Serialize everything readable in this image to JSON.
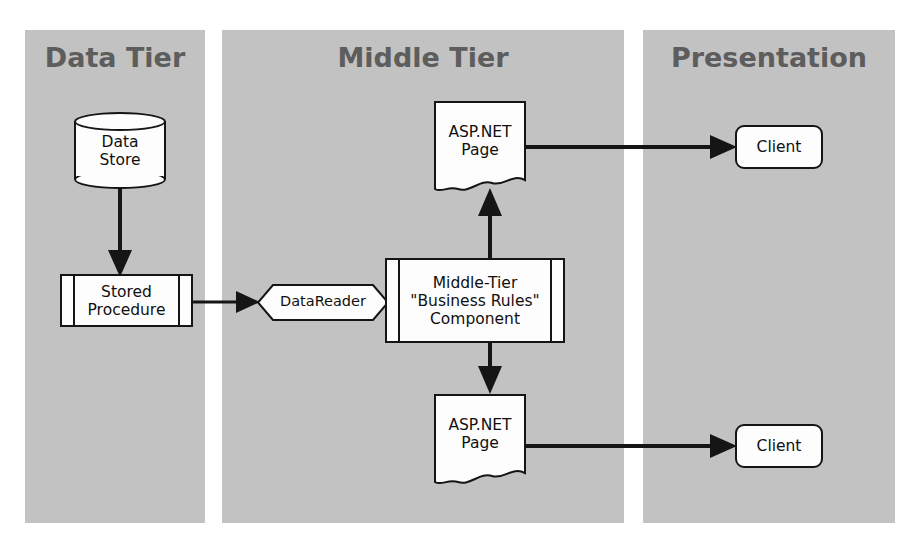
{
  "diagram": {
    "colors": {
      "panel_fill": "#c2c2c2",
      "tier_title": "#5d5d5d",
      "shape_fill": "#fdfdfd",
      "stroke": "#151515",
      "background": "#ffffff"
    },
    "tiers": [
      {
        "id": "data",
        "title": "Data Tier"
      },
      {
        "id": "middle",
        "title": "Middle Tier"
      },
      {
        "id": "presentation",
        "title": "Presentation"
      }
    ],
    "nodes": {
      "data_store": {
        "label": "Data\nStore",
        "shape": "cylinder",
        "tier": "data"
      },
      "stored_procedure": {
        "label": "Stored\nProcedure",
        "shape": "predefined-process",
        "tier": "data"
      },
      "datareader": {
        "label": "DataReader",
        "shape": "hexagon",
        "tier": "middle"
      },
      "business_rules": {
        "label": "Middle-Tier\n\"Business Rules\"\nComponent",
        "shape": "predefined-process",
        "tier": "middle"
      },
      "aspnet_page_top": {
        "label": "ASP.NET\nPage",
        "shape": "document",
        "tier": "middle"
      },
      "aspnet_page_bottom": {
        "label": "ASP.NET\nPage",
        "shape": "document",
        "tier": "middle"
      },
      "client_top": {
        "label": "Client",
        "shape": "rounded-rect",
        "tier": "presentation"
      },
      "client_bottom": {
        "label": "Client",
        "shape": "rounded-rect",
        "tier": "presentation"
      }
    },
    "edges": [
      {
        "from": "data_store",
        "to": "stored_procedure",
        "direction": "down",
        "arrowhead": true
      },
      {
        "from": "stored_procedure",
        "to": "datareader",
        "direction": "right",
        "arrowhead": true
      },
      {
        "from": "datareader",
        "to": "business_rules",
        "direction": "right",
        "arrowhead": false
      },
      {
        "from": "business_rules",
        "to": "aspnet_page_top",
        "direction": "up",
        "arrowhead": true
      },
      {
        "from": "business_rules",
        "to": "aspnet_page_bottom",
        "direction": "down",
        "arrowhead": true
      },
      {
        "from": "aspnet_page_top",
        "to": "client_top",
        "direction": "right",
        "arrowhead": true
      },
      {
        "from": "aspnet_page_bottom",
        "to": "client_bottom",
        "direction": "right",
        "arrowhead": true
      }
    ]
  }
}
